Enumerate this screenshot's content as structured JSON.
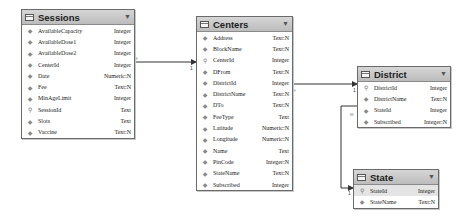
{
  "entities": [
    {
      "name": "Sessions",
      "fields": [
        {
          "name": "AvailableCapacity",
          "type": "Integer",
          "key": false
        },
        {
          "name": "AvailableDose1",
          "type": "Integer",
          "key": false
        },
        {
          "name": "AvailableDose2",
          "type": "Integer",
          "key": false
        },
        {
          "name": "CenterId",
          "type": "Integer",
          "key": false
        },
        {
          "name": "Date",
          "type": "Numeric:N",
          "key": false
        },
        {
          "name": "Fee",
          "type": "Text:N",
          "key": false
        },
        {
          "name": "MinAgeLimit",
          "type": "Integer",
          "key": false
        },
        {
          "name": "SessionId",
          "type": "Text",
          "key": true
        },
        {
          "name": "Slots",
          "type": "Text",
          "key": false
        },
        {
          "name": "Vaccine",
          "type": "Text:N",
          "key": false
        }
      ]
    },
    {
      "name": "Centers",
      "fields": [
        {
          "name": "Address",
          "type": "Text:N",
          "key": false
        },
        {
          "name": "BlockName",
          "type": "Text:N",
          "key": false
        },
        {
          "name": "CenterId",
          "type": "Integer",
          "key": true
        },
        {
          "name": "DFrom",
          "type": "Text:N",
          "key": false
        },
        {
          "name": "DistrictId",
          "type": "Integer",
          "key": false
        },
        {
          "name": "DistrictName",
          "type": "Text:N",
          "key": false
        },
        {
          "name": "DTo",
          "type": "Text:N",
          "key": false
        },
        {
          "name": "FeeType",
          "type": "Text",
          "key": false
        },
        {
          "name": "Latitude",
          "type": "Numeric:N",
          "key": false
        },
        {
          "name": "Longitude",
          "type": "Numeric:N",
          "key": false
        },
        {
          "name": "Name",
          "type": "Text",
          "key": false
        },
        {
          "name": "PinCode",
          "type": "Integer:N",
          "key": false
        },
        {
          "name": "StateName",
          "type": "Text:N",
          "key": false
        },
        {
          "name": "Subscribed",
          "type": "Integer",
          "key": false
        }
      ]
    },
    {
      "name": "District",
      "fields": [
        {
          "name": "DistrictId",
          "type": "Integer",
          "key": true
        },
        {
          "name": "DistrictName",
          "type": "Text:N",
          "key": false
        },
        {
          "name": "StateId",
          "type": "Integer",
          "key": false
        },
        {
          "name": "Subscribed",
          "type": "Integer:N",
          "key": false
        }
      ]
    },
    {
      "name": "State",
      "fields": [
        {
          "name": "StateId",
          "type": "Integer",
          "key": true
        },
        {
          "name": "StateName",
          "type": "Text:N",
          "key": false
        }
      ]
    }
  ],
  "relationships": [
    {
      "from": "Sessions.CenterId",
      "to": "Centers.CenterId",
      "from_card": "∞",
      "to_card": "1"
    },
    {
      "from": "Centers.DistrictId",
      "to": "District.DistrictId",
      "from_card": "∞",
      "to_card": "1"
    },
    {
      "from": "District.StateId",
      "to": "State.StateId",
      "from_card": "∞",
      "to_card": "1"
    }
  ],
  "icons": {
    "key": "key-icon",
    "field": "field-diamond-icon",
    "collapse": "chevron-down-icon",
    "table": "table-icon"
  }
}
